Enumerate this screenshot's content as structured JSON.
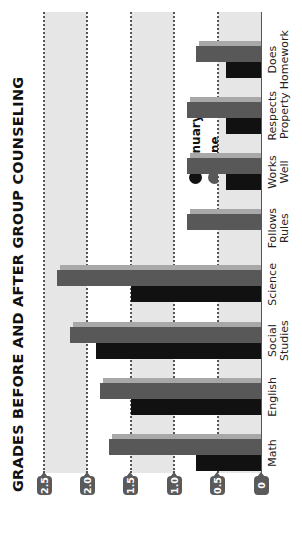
{
  "chart_data": {
    "type": "bar",
    "orientation": "vertical-bars, image rotated 90° counter-clockwise",
    "title": "GRADES BEFORE AND AFTER GROUP COUNSELING",
    "xlabel": "",
    "ylabel": "",
    "ylim": [
      0,
      2.5
    ],
    "yticks": [
      "0",
      "0.5",
      "1.0",
      "1.5",
      "2.0",
      "2.5"
    ],
    "grid": "dotted horizontal lines at each 0.5 with alternating shaded bands (0–0.5, 1.0–1.5, 2.0–2.5)",
    "legend_position": "upper-right (inside plot)",
    "categories": [
      "Math",
      "English",
      "Social Studies",
      "Science",
      "Follows Rules",
      "Works Well",
      "Respects Property",
      "Does Homework"
    ],
    "series": [
      {
        "name": "January",
        "color": "#111111",
        "values": [
          0.75,
          1.5,
          1.9,
          1.5,
          0.0,
          0.4,
          0.4,
          0.4
        ]
      },
      {
        "name": "June",
        "color": "#585858",
        "values": [
          1.75,
          1.85,
          2.2,
          2.35,
          0.85,
          0.85,
          0.85,
          0.75
        ]
      }
    ]
  },
  "chart": {
    "title": "GRADES BEFORE AND AFTER GROUP COUNSELING",
    "ticks": [
      "0",
      "0.5",
      "1.0",
      "1.5",
      "2.0",
      "2.5"
    ],
    "categories": [
      {
        "line1": "Math",
        "line2": ""
      },
      {
        "line1": "English",
        "line2": ""
      },
      {
        "line1": "Social",
        "line2": "Studies"
      },
      {
        "line1": "Science",
        "line2": ""
      },
      {
        "line1": "Follows",
        "line2": "Rules"
      },
      {
        "line1": "Works",
        "line2": "Well"
      },
      {
        "line1": "Respects",
        "line2": "Property"
      },
      {
        "line1": "Does",
        "line2": "Homework"
      }
    ],
    "legend": [
      {
        "label": "January",
        "color": "#111111"
      },
      {
        "label": "June",
        "color": "#585858"
      }
    ]
  }
}
